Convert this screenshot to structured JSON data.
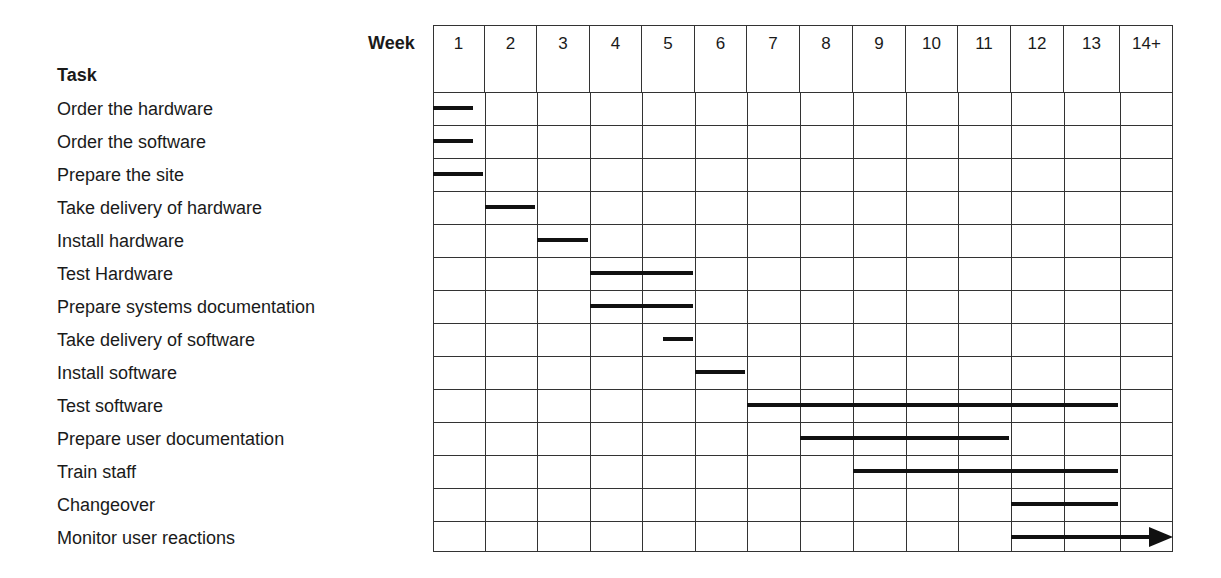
{
  "header": {
    "week_label": "Week",
    "task_label": "Task"
  },
  "chart_data": {
    "type": "gantt",
    "title": "",
    "xlabel": "Week",
    "ylabel": "Task",
    "categories": [
      "1",
      "2",
      "3",
      "4",
      "5",
      "6",
      "7",
      "8",
      "9",
      "10",
      "11",
      "12",
      "13",
      "14+"
    ],
    "grid": true,
    "tasks": [
      {
        "name": "Order the hardware",
        "start": 0,
        "end": 0.8
      },
      {
        "name": "Order the software",
        "start": 0,
        "end": 0.8
      },
      {
        "name": "Prepare the site",
        "start": 0,
        "end": 1
      },
      {
        "name": "Take delivery of hardware",
        "start": 1,
        "end": 2
      },
      {
        "name": "Install hardware",
        "start": 2,
        "end": 3
      },
      {
        "name": "Test Hardware",
        "start": 3,
        "end": 5
      },
      {
        "name": "Prepare systems documentation",
        "start": 3,
        "end": 5
      },
      {
        "name": "Take delivery of software",
        "start": 4.4,
        "end": 5
      },
      {
        "name": "Install software",
        "start": 5,
        "end": 6
      },
      {
        "name": "Test software",
        "start": 6,
        "end": 13
      },
      {
        "name": "Prepare user documentation",
        "start": 7,
        "end": 11
      },
      {
        "name": "Train staff",
        "start": 8,
        "end": 13
      },
      {
        "name": "Changeover",
        "start": 11,
        "end": 13
      },
      {
        "name": "Monitor user reactions",
        "start": 11,
        "end": 14,
        "ongoing": true
      }
    ]
  },
  "colors": {
    "bar": "#111111",
    "grid": "#333333",
    "text": "#1a1a1a",
    "background": "#ffffff"
  }
}
